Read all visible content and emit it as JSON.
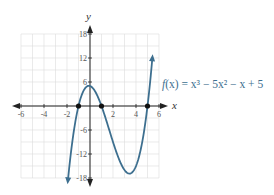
{
  "chart_data": {
    "type": "line",
    "title": "",
    "function_label": "f(x) = x³ − 5x² − x + 5",
    "xlabel": "x",
    "ylabel": "y",
    "xlim": [
      -6,
      6
    ],
    "ylim": [
      -18,
      18
    ],
    "x_ticks": [
      -6,
      -4,
      -2,
      2,
      4,
      6
    ],
    "y_ticks": [
      18,
      12,
      6,
      -6,
      -12,
      -18
    ],
    "x_tick_labels": [
      "-6",
      "-4",
      "-2",
      "2",
      "4",
      "6"
    ],
    "y_tick_labels": [
      "18",
      "12",
      "6",
      "-6",
      "-12",
      "-18"
    ],
    "grid": true,
    "grid_step": {
      "x": 1,
      "y": 3
    },
    "series": [
      {
        "name": "f(x) = x³ − 5x² − x + 5",
        "color": "#3d6f8f",
        "x": [
          -1.9,
          -1.5,
          -1,
          -0.5,
          0,
          0.5,
          1,
          1.5,
          2,
          2.5,
          3,
          3.5,
          4,
          4.5,
          5,
          5.4
        ],
        "y": [
          -16.7,
          -8.1,
          0,
          4.1,
          5,
          3.4,
          0,
          -3.9,
          -9,
          -11.3,
          -13,
          -13.1,
          -11.4,
          -7.1,
          0,
          8.0
        ]
      }
    ],
    "points": [
      {
        "x": -1,
        "y": 0,
        "label": "root"
      },
      {
        "x": 1,
        "y": 0,
        "label": "root"
      },
      {
        "x": 5,
        "y": 0,
        "label": "root"
      }
    ]
  },
  "labels": {
    "x_axis": "x",
    "y_axis": "y",
    "equation_prefix": "f",
    "equation_var": "(x) = x",
    "equation_rest": "³ − 5x² − x + 5"
  }
}
